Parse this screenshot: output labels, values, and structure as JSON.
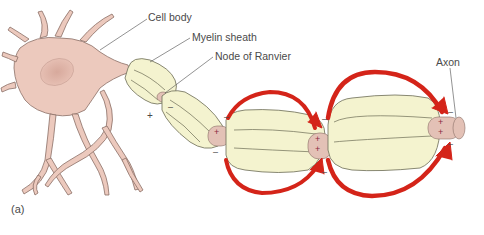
{
  "figure": {
    "panel_label": "(a)",
    "labels": {
      "cell_body": "Cell body",
      "myelin_sheath": "Myelin sheath",
      "node_of_ranvier": "Node of Ranvier",
      "axon": "Axon"
    },
    "signs": {
      "plus": "+",
      "minus": "–"
    },
    "colors": {
      "cell": "#ecc9bd",
      "cell_outline": "#8a6e66",
      "myelin": "#f4f3cf",
      "myelin_outline": "#6b6b55",
      "node": "#e3c1b6",
      "arrow": "#d42419",
      "arrow_dark": "#8a1710",
      "text": "#4a4a4a"
    }
  }
}
